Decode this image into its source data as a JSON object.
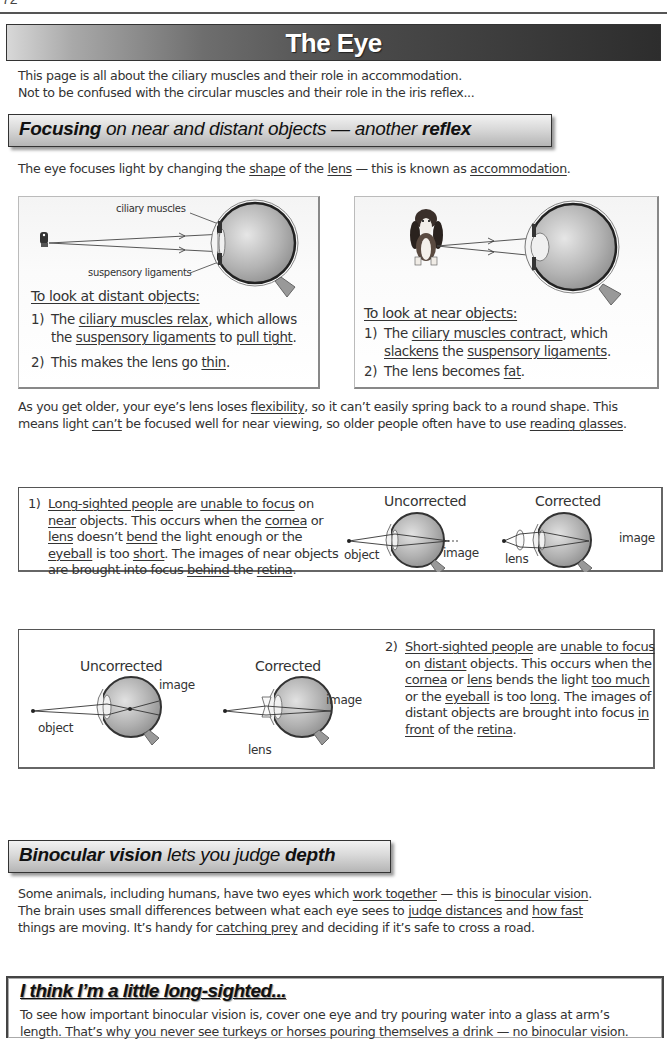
{
  "page": {
    "page_number": "72",
    "title": "The Eye",
    "intro": [
      "This page is all about the ciliary muscles and their role in accommodation.",
      "Not to be confused with the circular muscles and their role in the iris reflex..."
    ]
  },
  "section1": {
    "heading_bold1": "Focusing",
    "heading_mid": " on near and distant objects — another ",
    "heading_bold2": "reflex",
    "intro_parts": [
      "The eye focuses light by changing the ",
      "shape",
      " of the ",
      "lens",
      " — this is known as ",
      "accommodation",
      "."
    ],
    "distant": {
      "label_ciliary": "ciliary muscles",
      "label_suspensory": "suspensory ligaments",
      "heading": "To look at distant objects:",
      "item1_num": "1)",
      "item1_parts": [
        "The ",
        "ciliary muscles relax",
        ", which allows"
      ],
      "item1_line2_parts": [
        "the ",
        "suspensory ligaments",
        " to ",
        "pull tight",
        "."
      ],
      "item2_num": "2)",
      "item2_parts": [
        "This makes the lens go ",
        "thin",
        "."
      ]
    },
    "near": {
      "heading": "To look at near objects:",
      "item1_num": "1)",
      "item1_parts": [
        "The ",
        "ciliary muscles contract",
        ", which"
      ],
      "item1_line2_parts": [
        "slackens",
        " the ",
        "suspensory ligaments",
        "."
      ],
      "item2_num": "2)",
      "item2_parts": [
        "The lens becomes ",
        "fat",
        "."
      ]
    },
    "older_line1": [
      "As you get older, your eye’s lens loses ",
      "flexibility",
      ", so it can’t easily spring back to a round shape.  This"
    ],
    "older_line2": [
      "means light ",
      "can’t",
      " be focused well for near viewing, so older people often have to use ",
      "reading glasses",
      "."
    ]
  },
  "long_sighted": {
    "num": "1)",
    "lines": [
      [
        "",
        "Long-sighted people",
        " are ",
        "unable to focus",
        " on"
      ],
      [
        "",
        "near",
        " objects.  This occurs when the ",
        "cornea",
        " or"
      ],
      [
        "",
        "lens",
        " doesn’t ",
        "bend",
        " the light enough or the"
      ],
      [
        "",
        "eyeball",
        " is too ",
        "short",
        ".  The images of near objects"
      ],
      [
        "are brought into focus ",
        "behind",
        " the ",
        "retina",
        "."
      ]
    ],
    "uncorrected_caption": "Uncorrected",
    "corrected_caption": "Corrected",
    "label_object": "object",
    "label_image": "image",
    "label_lens": "lens",
    "label_image2": "image"
  },
  "short_sighted": {
    "num": "2)",
    "lines": [
      [
        "",
        "Short-sighted people",
        " are ",
        "unable to focus",
        ""
      ],
      [
        "on ",
        "distant",
        " objects.  This occurs when the",
        "",
        ""
      ],
      [
        "",
        "cornea",
        " or ",
        "lens",
        " bends the light ",
        "too much",
        ""
      ],
      [
        "or the ",
        "eyeball",
        " is too ",
        "long",
        ".  The images of"
      ],
      [
        "distant objects are brought into focus ",
        "in",
        ""
      ],
      [
        "",
        "front",
        " of the ",
        "retina",
        "."
      ]
    ],
    "uncorrected_caption": "Uncorrected",
    "corrected_caption": "Corrected",
    "label_object": "object",
    "label_image": "image",
    "label_lens": "lens",
    "label_image2": "image"
  },
  "section2": {
    "heading_bold1": "Binocular vision",
    "heading_mid": " lets you judge ",
    "heading_bold2": "depth",
    "lines": [
      [
        "Some animals, including humans, have two eyes which ",
        "work together",
        " — this is ",
        "binocular vision",
        "."
      ],
      [
        "The brain uses small differences between what each eye sees to ",
        "judge distances",
        " and ",
        "how fast",
        ""
      ],
      [
        "things are moving.  It’s handy for ",
        "catching prey",
        " and deciding if it’s safe to cross a road.",
        "",
        ""
      ]
    ]
  },
  "tip": {
    "title": "I think I’m a little long-sighted...",
    "lines": [
      "To see how important binocular vision is, cover one eye and try pouring water into a glass at arm’s",
      "length.  That’s why you never see turkeys or horses pouring themselves a drink — no binocular vision."
    ]
  },
  "colors": {
    "banner_dark": "#2d2d2d",
    "banner_light": "#d8d8d8",
    "eye_gray": "#9a9a9a",
    "text": "#333333"
  }
}
